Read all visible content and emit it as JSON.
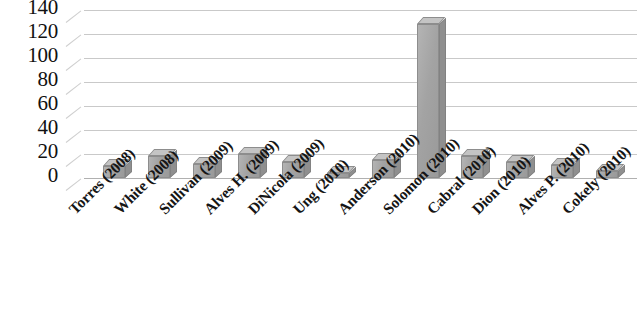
{
  "chart_data": {
    "type": "bar",
    "title": "",
    "subtitle": "",
    "xlabel": "",
    "ylabel": "",
    "ylim": [
      0,
      140
    ],
    "y_ticks": [
      140,
      120,
      100,
      80,
      60,
      40,
      20,
      0
    ],
    "grid": true,
    "legend": "none",
    "style": "3d-column",
    "bar_color": "#a3a3a3",
    "gridline_color": "#c9c9c9",
    "categories": [
      "Torres (2008)",
      "White (2008)",
      "Sullivan (2009)",
      "Alves H. (2009)",
      "DiNicola (2009)",
      "Ung (2010)",
      "Anderson (2010)",
      "Solomon (2010)",
      "Cabral (2010)",
      "Dion (2010)",
      "Alves P. (2010)",
      "Cokely (2010)"
    ],
    "values": [
      10,
      18,
      12,
      20,
      13,
      4,
      15,
      128,
      18,
      13,
      11,
      6
    ]
  }
}
